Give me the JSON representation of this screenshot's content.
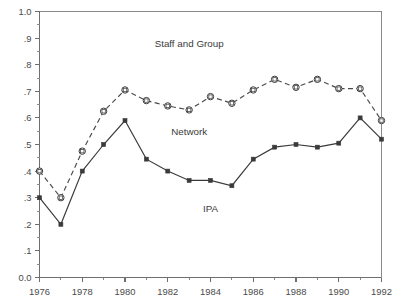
{
  "chart_data": {
    "type": "line",
    "title": "",
    "subtitle": "",
    "xlabel": "",
    "ylabel": "",
    "xlim": [
      1976,
      1992
    ],
    "ylim": [
      0.0,
      1.0
    ],
    "grid": false,
    "legend_position": "inline-annotations",
    "x": [
      1976,
      1977,
      1978,
      1979,
      1980,
      1981,
      1982,
      1983,
      1984,
      1985,
      1986,
      1987,
      1988,
      1989,
      1990,
      1991,
      1992
    ],
    "x_tick_labels": [
      "1976",
      "1978",
      "1980",
      "1982",
      "1984",
      "1986",
      "1988",
      "1990",
      "1992"
    ],
    "x_tick_values": [
      1976,
      1978,
      1980,
      1982,
      1984,
      1986,
      1988,
      1990,
      1992
    ],
    "y_tick_labels": [
      "0.0",
      ".1",
      ".2",
      ".3",
      ".4",
      ".5",
      ".6",
      ".7",
      ".8",
      ".9",
      "1.0"
    ],
    "y_tick_values": [
      0.0,
      0.1,
      0.2,
      0.3,
      0.4,
      0.5,
      0.6,
      0.7,
      0.8,
      0.9,
      1.0
    ],
    "series": [
      {
        "name": "Staff and Group",
        "style": "dashed",
        "marker": "open-square",
        "color": "#4a4a4a",
        "values": [
          0.4,
          0.3,
          0.475,
          0.625,
          0.705,
          0.665,
          0.645,
          0.63,
          0.68,
          0.655,
          0.705,
          0.745,
          0.715,
          0.745,
          0.71,
          0.71,
          0.59
        ]
      },
      {
        "name": "Network / IPA",
        "style": "solid",
        "marker": "filled-square",
        "color": "#3a3a3a",
        "values": [
          0.3,
          0.2,
          0.4,
          0.5,
          0.59,
          0.445,
          0.4,
          0.365,
          0.365,
          0.345,
          0.445,
          0.49,
          0.5,
          0.49,
          0.505,
          0.6,
          0.52
        ]
      }
    ],
    "annotations": [
      {
        "text": "Staff and Group",
        "x": 1983.0,
        "y": 0.865
      },
      {
        "text": "Network",
        "x": 1983.0,
        "y": 0.535
      },
      {
        "text": "IPA",
        "x": 1984.0,
        "y": 0.245
      }
    ]
  }
}
